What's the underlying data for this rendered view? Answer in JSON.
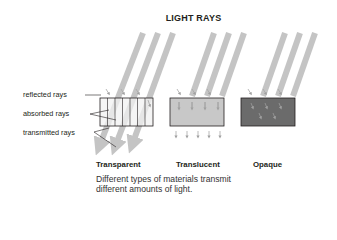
{
  "title": "LIGHT RAYS",
  "labels": {
    "reflected": "reflected rays",
    "absorbed": "absorbed rays",
    "transmitted": "transmitted rays"
  },
  "materials": [
    {
      "name": "Transparent",
      "fill": "#f2f2f2",
      "dividers": true
    },
    {
      "name": "Translucent",
      "fill": "#c8c8c8",
      "dividers": false
    },
    {
      "name": "Opaque",
      "fill": "#6b6b6b",
      "dividers": false
    }
  ],
  "caption": {
    "line1": "Different types of materials transmit",
    "line2": "different amounts of light."
  },
  "colors": {
    "ray": "#c4c4c4",
    "outline": "#231f20",
    "small_arrow": "#a8a8a8"
  }
}
